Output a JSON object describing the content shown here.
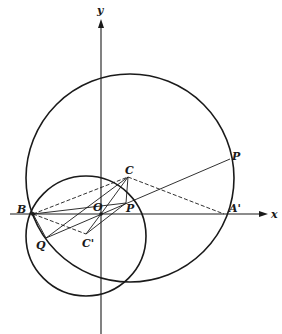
{
  "diagram": {
    "axes": {
      "x_label": "x",
      "y_label": "y"
    },
    "points": {
      "O": {
        "label": "O",
        "x": 101,
        "y": 214
      },
      "B": {
        "label": "B",
        "x": 33,
        "y": 214
      },
      "A_prime": {
        "label": "A'",
        "x": 224,
        "y": 214
      },
      "C": {
        "label": "C",
        "x": 128,
        "y": 177
      },
      "C_prime": {
        "label": "C'",
        "x": 86,
        "y": 234
      },
      "P_small": {
        "label": "P",
        "x": 126,
        "y": 203
      },
      "P_large": {
        "label": "P",
        "x": 230,
        "y": 159
      },
      "Q": {
        "label": "Q",
        "x": 46,
        "y": 238
      }
    },
    "circles": [
      {
        "name": "large-circle",
        "cx": 130,
        "cy": 178,
        "r": 104
      },
      {
        "name": "small-circle",
        "cx": 86,
        "cy": 236,
        "r": 60
      }
    ],
    "stroke_color": "#1a1a1a"
  }
}
